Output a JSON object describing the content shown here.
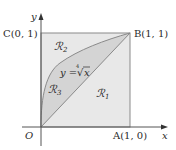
{
  "figure": {
    "axes": {
      "x_label": "x",
      "y_label": "y",
      "origin_label": "O"
    },
    "points": {
      "A": "A(1, 0)",
      "B": "B(1, 1)",
      "C": "C(0, 1)"
    },
    "regions": {
      "R1": {
        "symbol": "ℛ",
        "sub": "1"
      },
      "R2": {
        "symbol": "ℛ",
        "sub": "2"
      },
      "R3": {
        "symbol": "ℛ",
        "sub": "3"
      }
    },
    "curve_label": {
      "lhs": "y =",
      "root_index": "4",
      "radical": "√",
      "radicand": "x"
    },
    "colors": {
      "background": "#ffffff",
      "square_fill": "#e8e8e8",
      "region3_fill": "#d4d4d4",
      "lines": "#8a8a8a",
      "axes": "#555555",
      "text": "#2a2a2a"
    }
  }
}
